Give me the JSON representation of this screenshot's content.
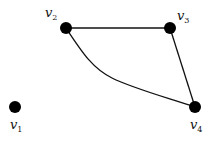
{
  "diagram": {
    "type": "graph",
    "nodes": [
      {
        "id": "v1",
        "label": "v",
        "sub": "1",
        "x": 15,
        "y": 107
      },
      {
        "id": "v2",
        "label": "v",
        "sub": "2",
        "x": 66,
        "y": 28
      },
      {
        "id": "v3",
        "label": "v",
        "sub": "3",
        "x": 170,
        "y": 28
      },
      {
        "id": "v4",
        "label": "v",
        "sub": "4",
        "x": 195,
        "y": 107
      }
    ],
    "edges": [
      {
        "from": "v2",
        "to": "v3",
        "shape": "straight"
      },
      {
        "from": "v3",
        "to": "v4",
        "shape": "straight"
      },
      {
        "from": "v2",
        "to": "v4",
        "shape": "curved"
      }
    ],
    "colors": {
      "node": "#000000",
      "edge": "#111111",
      "background": "#ffffff"
    }
  }
}
